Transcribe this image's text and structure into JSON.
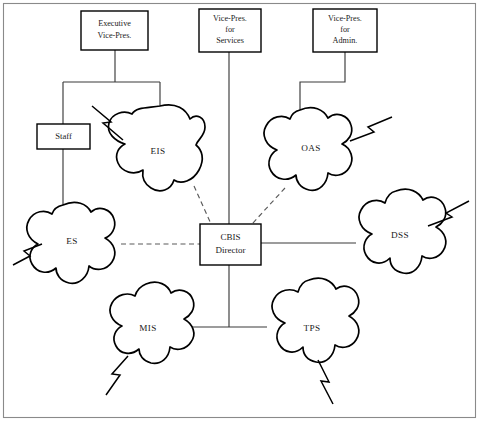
{
  "diagram": {
    "background_color": "#ffffff",
    "line_color": "#000000",
    "frame_color": "#8a8a8a",
    "boxes": [
      {
        "id": "executive-vice-pres",
        "lines": [
          "Executive",
          "Vice-Pres."
        ],
        "x": 81,
        "y": 11,
        "w": 67,
        "h": 39
      },
      {
        "id": "vice-pres-services",
        "lines": [
          "Vice-Pres.",
          "for",
          "Services"
        ],
        "x": 199,
        "y": 9,
        "w": 62,
        "h": 43
      },
      {
        "id": "vice-pres-admin",
        "lines": [
          "Vice-Pres.",
          "for",
          "Admin."
        ],
        "x": 313,
        "y": 9,
        "w": 64,
        "h": 43
      },
      {
        "id": "staff",
        "lines": [
          "Staff"
        ],
        "x": 37,
        "y": 124,
        "w": 53,
        "h": 25
      },
      {
        "id": "cbis-director",
        "lines": [
          "CBIS",
          "Director"
        ],
        "x": 200,
        "y": 224,
        "w": 61,
        "h": 41
      }
    ],
    "blobs": [
      {
        "id": "eis",
        "label": "EIS",
        "cx": 158,
        "cy": 151
      },
      {
        "id": "oas",
        "label": "OAS",
        "cx": 311,
        "cy": 148
      },
      {
        "id": "es",
        "label": "ES",
        "cx": 72,
        "cy": 241
      },
      {
        "id": "dss",
        "label": "DSS",
        "cx": 401,
        "cy": 235
      },
      {
        "id": "mis",
        "label": "MIS",
        "cx": 148,
        "cy": 328
      },
      {
        "id": "tps",
        "label": "TPS",
        "cx": 312,
        "cy": 328
      }
    ],
    "connections": [
      {
        "from": "executive-vice-pres",
        "to": "staff",
        "style": "solid"
      },
      {
        "from": "executive-vice-pres",
        "to": "eis",
        "style": "solid"
      },
      {
        "from": "vice-pres-services",
        "to": "cbis-director",
        "style": "solid"
      },
      {
        "from": "vice-pres-admin",
        "to": "oas",
        "style": "solid"
      },
      {
        "from": "staff",
        "to": "es",
        "style": "solid"
      },
      {
        "from": "eis",
        "to": "cbis-director",
        "style": "dashed"
      },
      {
        "from": "oas",
        "to": "cbis-director",
        "style": "dashed"
      },
      {
        "from": "es",
        "to": "cbis-director",
        "style": "dashed"
      },
      {
        "from": "dss",
        "to": "cbis-director",
        "style": "solid"
      },
      {
        "from": "mis",
        "to": "cbis-director",
        "style": "solid"
      },
      {
        "from": "tps",
        "to": "cbis-director",
        "style": "solid"
      }
    ],
    "lightning_bolts": [
      {
        "id": "bolt-eis",
        "attached_to": "eis",
        "direction": "upper-left"
      },
      {
        "id": "bolt-oas",
        "attached_to": "oas",
        "direction": "upper-right"
      },
      {
        "id": "bolt-es",
        "attached_to": "es",
        "direction": "lower-left"
      },
      {
        "id": "bolt-dss",
        "attached_to": "dss",
        "direction": "upper-right"
      },
      {
        "id": "bolt-mis",
        "attached_to": "mis",
        "direction": "lower-left"
      },
      {
        "id": "bolt-tps",
        "attached_to": "tps",
        "direction": "lower-right"
      }
    ]
  }
}
